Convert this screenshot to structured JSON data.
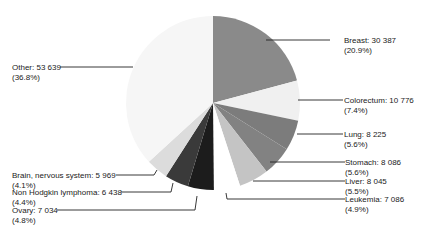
{
  "chart_data": {
    "type": "pie",
    "title": "",
    "start_angle_deg": 0,
    "direction": "clockwise",
    "slices": [
      {
        "label": "Breast",
        "value": 30387,
        "value_text": "30 387",
        "percent": 20.9,
        "percent_text": "(20.9%)",
        "color": "#8a8a8a"
      },
      {
        "label": "Colorectum",
        "value": 10776,
        "value_text": "10 776",
        "percent": 7.4,
        "percent_text": "(7.4%)",
        "color": "#f0f0f0"
      },
      {
        "label": "Lung",
        "value": 8225,
        "value_text": "8 225",
        "percent": 5.6,
        "percent_text": "(5.6%)",
        "color": "#7c7c7c"
      },
      {
        "label": "Stomach",
        "value": 8086,
        "value_text": "8 086",
        "percent": 5.6,
        "percent_text": "(5.6%)",
        "color": "#828282"
      },
      {
        "label": "Liver",
        "value": 8045,
        "value_text": "8 045",
        "percent": 5.5,
        "percent_text": "(5.5%)",
        "color": "#c4c4c4"
      },
      {
        "label": "Leukemia",
        "value": 7086,
        "value_text": "7 086",
        "percent": 4.9,
        "percent_text": "(4.9%)",
        "color": "#ffffff"
      },
      {
        "label": "Ovary",
        "value": 7034,
        "value_text": "7 034",
        "percent": 4.8,
        "percent_text": "(4.8%)",
        "color": "#1c1c1c"
      },
      {
        "label": "Non Hodgkin lymphoma",
        "value": 6438,
        "value_text": "6 438",
        "percent": 4.4,
        "percent_text": "(4.4%)",
        "color": "#3a3a3a"
      },
      {
        "label": "Brain, nervous system",
        "value": 5969,
        "value_text": "5 969",
        "percent": 4.1,
        "percent_text": "(4.1%)",
        "color": "#dcdcdc"
      },
      {
        "label": "Other",
        "value": 53639,
        "value_text": "53 639",
        "percent": 36.8,
        "percent_text": "(36.8%)",
        "color": "#f6f6f6"
      }
    ]
  },
  "labels": [
    {
      "line1": "Breast: 30 387",
      "line2": "(20.9%)"
    },
    {
      "line1": "Colorectum: 10 776",
      "line2": "(7.4%)"
    },
    {
      "line1": "Lung: 8 225",
      "line2": "(5.6%)"
    },
    {
      "line1": "Stomach: 8 086",
      "line2": "(5.6%)"
    },
    {
      "line1": "Liver: 8 045",
      "line2": "(5.5%)"
    },
    {
      "line1": "Leukemia: 7 086",
      "line2": "(4.9%)"
    },
    {
      "line1": "Ovary: 7 034",
      "line2": "(4.8%)"
    },
    {
      "line1": "Non Hodgkin lymphoma: 6 438",
      "line2": "(4.4%)"
    },
    {
      "line1": "Brain, nervous system: 5 969",
      "line2": "(4.1%)"
    },
    {
      "line1": "Other: 53 639",
      "line2": "(36.8%)"
    }
  ]
}
